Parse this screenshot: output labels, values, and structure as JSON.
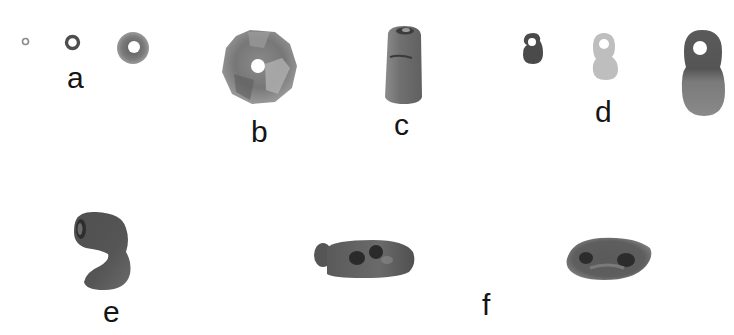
{
  "figure": {
    "groups": [
      {
        "label": "a",
        "items": [
          "small-ring-bead",
          "medium-ring-bead",
          "large-ring-bead"
        ]
      },
      {
        "label": "b",
        "items": [
          "disc-bead"
        ]
      },
      {
        "label": "c",
        "items": [
          "cylinder-bead"
        ]
      },
      {
        "label": "d",
        "items": [
          "small-dark-figure-eight-pendant",
          "light-figure-eight-pendant",
          "large-figure-eight-pendant"
        ]
      },
      {
        "label": "e",
        "items": [
          "curved-hook-bead"
        ]
      },
      {
        "label": "f",
        "items": [
          "elongated-perforated-bead-side-view",
          "elongated-perforated-bead-other-view"
        ]
      }
    ]
  },
  "labels": {
    "a": "a",
    "b": "b",
    "c": "c",
    "d": "d",
    "e": "e",
    "f": "f"
  },
  "colors": {
    "background": "#ffffff",
    "text": "#151515",
    "bead_dark": "#4a4a4a",
    "bead_mid": "#707070",
    "bead_light": "#bdbdbd"
  }
}
